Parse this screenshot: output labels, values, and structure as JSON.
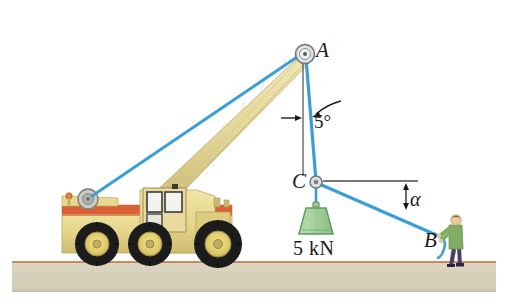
{
  "figure": {
    "background_color": "#ffffff"
  },
  "labels": {
    "point_a": "A",
    "point_b": "B",
    "point_c": "C",
    "angle_vertical": "5°",
    "angle_alpha": "α",
    "load_weight": "5 kN"
  },
  "colors": {
    "cable": "#3a9fd8",
    "cable_dark": "#2b8cc4",
    "boom": "#e3d79a",
    "boom_shade": "#cfc07c",
    "body": "#e8d98f",
    "body_shade": "#d4c377",
    "stripe": "#d9552c",
    "tire": "#1c1c1c",
    "hub": "#e3cf6a",
    "weight": "#a9d3a0",
    "weight_edge": "#5f9a63",
    "ground": "#d9d3c0",
    "ground_line": "#c06a33",
    "reference_line": "#5a5a5a",
    "label_text": "#1a1a1a",
    "worker_shirt": "#7fae63",
    "worker_pants": "#4a3f6b",
    "worker_skin": "#e8c89a"
  },
  "geometry": {
    "point_a": {
      "x": 306,
      "y": 52
    },
    "point_c": {
      "x": 316,
      "y": 182
    },
    "point_b": {
      "x": 440,
      "y": 238
    },
    "winch": {
      "x": 88,
      "y": 199
    },
    "vertical_line": {
      "x": 303,
      "y_top": 62,
      "y_bottom": 175
    },
    "horizontal_line": {
      "x_start": 322,
      "x_end": 418,
      "y": 181
    },
    "angle_vertical_deg": 5,
    "ground_top_y": 262
  },
  "icons": {
    "pulley_a": "pulley-icon",
    "ring_c": "ring-icon",
    "winch_drum": "winch-drum-icon",
    "weight_block": "weight-block-icon",
    "worker": "worker-icon"
  }
}
